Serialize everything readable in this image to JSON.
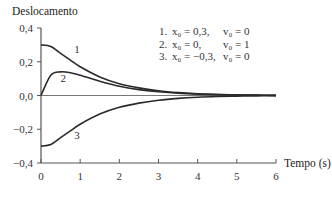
{
  "chart_data": {
    "type": "line",
    "title": "",
    "ylabel": "Deslocamento",
    "xlabel": "Tempo (s)",
    "xlim": [
      0,
      6
    ],
    "ylim": [
      -0.4,
      0.4
    ],
    "x_ticks": [
      0,
      1,
      2,
      3,
      4,
      5,
      6
    ],
    "x_tick_labels": [
      "0",
      "1",
      "2",
      "3",
      "4",
      "5",
      "6"
    ],
    "y_ticks": [
      0.4,
      0.2,
      0.0,
      -0.2,
      -0.4
    ],
    "y_tick_labels": [
      "0,4",
      "0,2",
      "0,0",
      "−0,2",
      "−0,4"
    ],
    "grid": false,
    "legend_position": "upper right (text block)",
    "x": [
      0,
      0.25,
      0.5,
      0.75,
      1,
      1.5,
      2,
      2.5,
      3,
      3.5,
      4,
      4.5,
      5,
      5.5,
      6
    ],
    "series": [
      {
        "name": "1",
        "label": "1. x0 = 0,3, v0 = 0",
        "x0": 0.3,
        "v0": 0,
        "values": [
          0.3,
          0.29,
          0.25,
          0.21,
          0.17,
          0.11,
          0.07,
          0.045,
          0.028,
          0.017,
          0.01,
          0.006,
          0.004,
          0.002,
          0.001
        ]
      },
      {
        "name": "2",
        "label": "2. x0 = 0, v0 = 1",
        "x0": 0,
        "v0": 1,
        "values": [
          0.0,
          0.12,
          0.14,
          0.135,
          0.12,
          0.085,
          0.055,
          0.035,
          0.022,
          0.013,
          0.008,
          0.005,
          0.003,
          0.002,
          0.001
        ]
      },
      {
        "name": "3",
        "label": "3. x0 = −0,3, v0 = 0",
        "x0": -0.3,
        "v0": 0,
        "values": [
          -0.3,
          -0.29,
          -0.25,
          -0.21,
          -0.17,
          -0.11,
          -0.07,
          -0.045,
          -0.028,
          -0.017,
          -0.01,
          -0.006,
          -0.004,
          -0.002,
          -0.001
        ]
      }
    ],
    "annotations": [
      {
        "text": "1",
        "x": 0.85,
        "y": 0.25
      },
      {
        "text": "2",
        "x": 0.5,
        "y": 0.08
      },
      {
        "text": "3",
        "x": 0.85,
        "y": -0.255
      }
    ]
  },
  "legend": {
    "rows": [
      {
        "num": "1.",
        "x0": "x₀ = 0,3,",
        "v0": "v₀ = 0"
      },
      {
        "num": "2.",
        "x0": "x₀ = 0,",
        "v0": "v₀ = 1"
      },
      {
        "num": "3.",
        "x0": "x₀ = −0,3,",
        "v0": "v₀ = 0"
      }
    ]
  },
  "colors": {
    "curve": "#2a2a2a",
    "axis": "#555555",
    "text": "#333333"
  }
}
